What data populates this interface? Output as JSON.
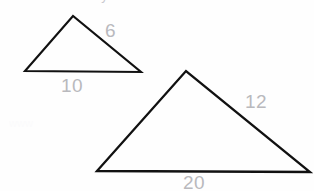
{
  "page": {
    "background_color": "#fefefe",
    "ink_color": "#111111",
    "label_color": "#b9b9bd",
    "cutoff_heading_text": "Are not similar by AA.",
    "smudge_text": "www"
  },
  "figure": {
    "caption": "two-triangles-similarity-figure",
    "shapes": [
      {
        "name": "small-triangle",
        "points": "25,71 73,16 141,72",
        "vertices": [
          {
            "name": "apex",
            "x": 73,
            "y": 16
          },
          {
            "name": "bottom-left",
            "x": 25,
            "y": 71
          },
          {
            "name": "bottom-right",
            "x": 141,
            "y": 72
          }
        ],
        "labels": [
          {
            "name": "small-triangle-right-side-label",
            "text": "6",
            "x": 105,
            "y": 21
          },
          {
            "name": "small-triangle-base-label",
            "text": "10",
            "x": 61,
            "y": 76
          }
        ]
      },
      {
        "name": "large-triangle",
        "points": "97,171 186,71 310,172",
        "vertices": [
          {
            "name": "apex",
            "x": 186,
            "y": 71
          },
          {
            "name": "bottom-left",
            "x": 97,
            "y": 171
          },
          {
            "name": "bottom-right",
            "x": 310,
            "y": 172
          }
        ],
        "labels": [
          {
            "name": "large-triangle-right-side-label",
            "text": "12",
            "x": 245,
            "y": 92
          },
          {
            "name": "large-triangle-base-label",
            "text": "20",
            "x": 183,
            "y": 173
          }
        ]
      }
    ]
  },
  "labels": {
    "small_right": "6",
    "small_base": "10",
    "large_right": "12",
    "large_base": "20"
  }
}
